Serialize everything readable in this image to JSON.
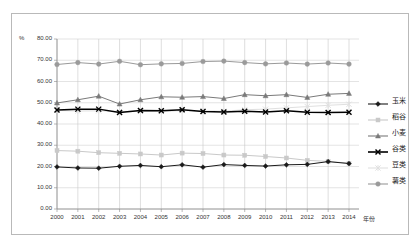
{
  "axis": {
    "unit_label": "%",
    "x_title": "年份",
    "y_ticks": [
      "0.00",
      "10.00",
      "20.00",
      "30.00",
      "40.00",
      "50.00",
      "60.00",
      "70.00",
      "80.00"
    ],
    "x_ticks": [
      "2000",
      "2001",
      "2002",
      "2003",
      "2004",
      "2005",
      "2006",
      "2007",
      "2008",
      "2009",
      "2010",
      "2011",
      "2012",
      "2013",
      "2014"
    ]
  },
  "legend": {
    "items": [
      {
        "label": "玉米",
        "color": "#1a1a1a",
        "marker": "diamond"
      },
      {
        "label": "稻谷",
        "color": "#c9c9c9",
        "marker": "square"
      },
      {
        "label": "小麦",
        "color": "#7a7a7a",
        "marker": "triangle"
      },
      {
        "label": "谷类",
        "color": "#000000",
        "marker": "x-bold"
      },
      {
        "label": "豆类",
        "color": "#e0e0e0",
        "marker": "star"
      },
      {
        "label": "薯类",
        "color": "#9a9a9a",
        "marker": "circle"
      }
    ]
  },
  "chart_data": {
    "type": "line",
    "title": "",
    "xlabel": "年份",
    "ylabel": "%",
    "xlim": [
      2000,
      2014
    ],
    "ylim": [
      0,
      80
    ],
    "ytick_step": 10,
    "grid": true,
    "legend_position": "right",
    "x": [
      2000,
      2001,
      2002,
      2003,
      2004,
      2005,
      2006,
      2007,
      2008,
      2009,
      2010,
      2011,
      2012,
      2013,
      2014
    ],
    "series": [
      {
        "name": "玉米",
        "color": "#1a1a1a",
        "marker": "diamond",
        "values": [
          19.8,
          19.3,
          19.2,
          20.1,
          20.5,
          19.9,
          20.8,
          19.7,
          20.9,
          20.5,
          20.2,
          20.8,
          21.0,
          22.3,
          21.4
        ]
      },
      {
        "name": "稻谷",
        "color": "#c9c9c9",
        "marker": "square",
        "values": [
          27.5,
          27.2,
          26.5,
          26.2,
          25.9,
          25.4,
          26.3,
          26.1,
          25.4,
          25.3,
          24.7,
          24.0,
          22.9,
          22.4,
          21.5
        ]
      },
      {
        "name": "小麦",
        "color": "#7a7a7a",
        "marker": "triangle",
        "values": [
          49.9,
          51.4,
          53.1,
          49.4,
          51.4,
          52.8,
          52.6,
          52.9,
          52.0,
          53.8,
          53.3,
          53.8,
          52.5,
          54.0,
          54.4
        ]
      },
      {
        "name": "谷类",
        "color": "#000000",
        "marker": "x-bold",
        "values": [
          46.6,
          47.0,
          47.0,
          45.4,
          46.3,
          46.2,
          46.7,
          45.9,
          45.7,
          46.0,
          45.7,
          46.2,
          45.5,
          45.4,
          45.5
        ]
      },
      {
        "name": "豆类",
        "color": "#e0e0e0",
        "marker": "star",
        "values": [
          46.4,
          46.1,
          46.2,
          45.9,
          46.0,
          45.9,
          46.3,
          46.2,
          46.0,
          46.7,
          47.0,
          47.6,
          48.2,
          48.8,
          49.3
        ]
      },
      {
        "name": "薯类",
        "color": "#9a9a9a",
        "marker": "circle",
        "values": [
          68.0,
          68.9,
          68.2,
          69.5,
          67.9,
          68.3,
          68.5,
          69.4,
          69.6,
          68.9,
          68.3,
          68.7,
          68.2,
          68.7,
          68.2
        ]
      }
    ]
  }
}
